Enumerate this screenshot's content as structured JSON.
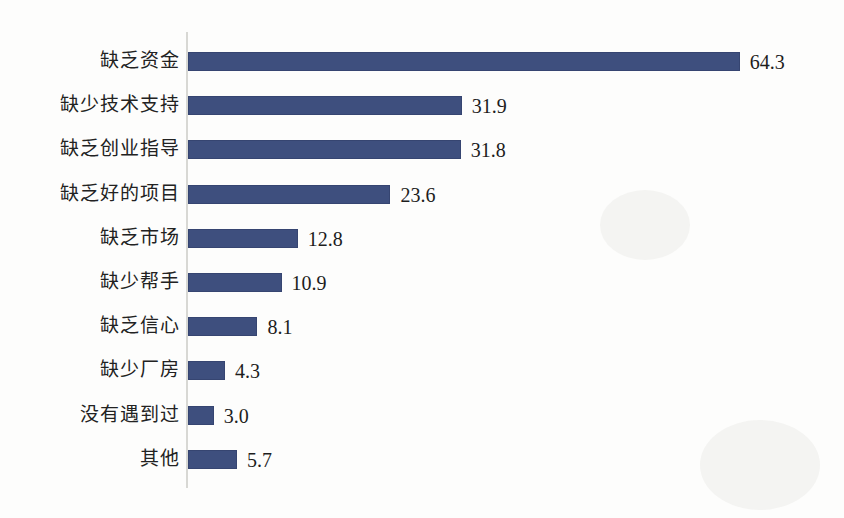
{
  "chart_data": {
    "type": "bar",
    "orientation": "horizontal",
    "title": "",
    "subtitle": "",
    "xlabel": "",
    "ylabel": "",
    "categories": [
      "缺乏资金",
      "缺少技术支持",
      "缺乏创业指导",
      "缺乏好的项目",
      "缺乏市场",
      "缺少帮手",
      "缺乏信心",
      "缺少厂房",
      "没有遇到过",
      "其他"
    ],
    "values": [
      64.3,
      31.9,
      31.8,
      23.6,
      12.8,
      10.9,
      8.1,
      4.3,
      3.0,
      5.7
    ],
    "value_labels": [
      "64.3",
      "31.9",
      "31.8",
      "23.6",
      "12.8",
      "10.9",
      "8.1",
      "4.3",
      "3.0",
      "5.7"
    ],
    "xlim": [
      0,
      64.3
    ],
    "grid": false,
    "legend": null,
    "legend_position": "none",
    "bar_color": "#3e4f7e",
    "axis_color": "#d8d8d4",
    "label_color": "#222222",
    "value_label_color": "#1d1d1d",
    "background_color": "#fdfdfc",
    "data_labels_shown": true,
    "axis_tick_labels": []
  }
}
